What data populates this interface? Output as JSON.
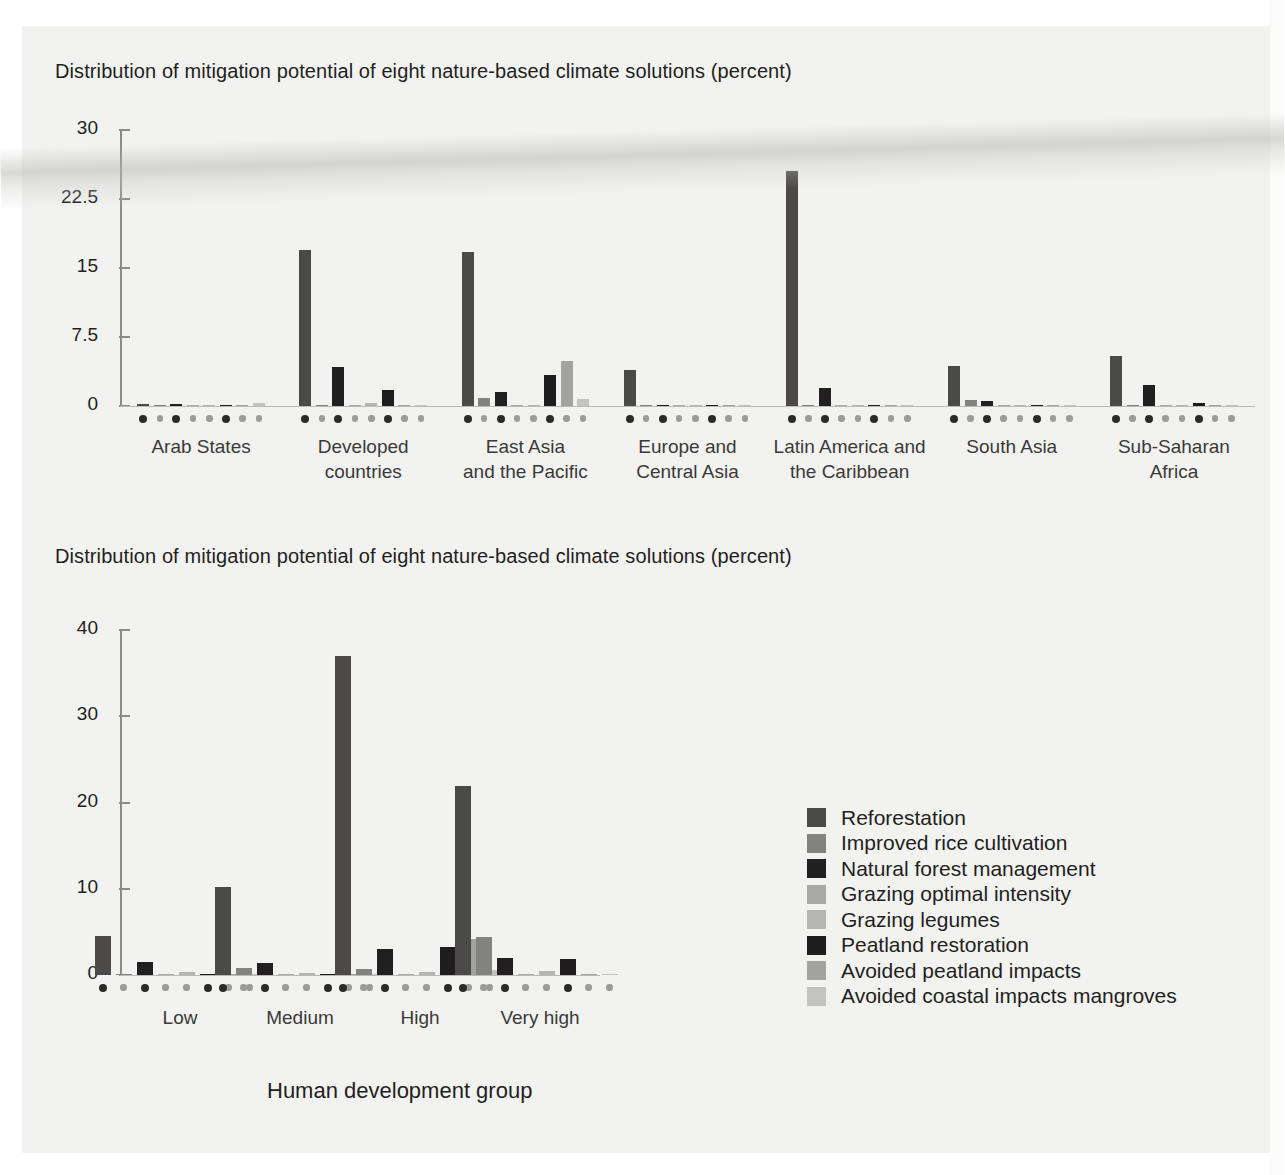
{
  "page": {
    "background": "#f2f2f0",
    "axis_color": "#8b8b88",
    "text_color": "#231f20"
  },
  "series_colors": {
    "reforestation": "#4c4a49",
    "improved_rice_cultivation": "#828281",
    "natural_forest_management": "#211f1f",
    "grazing_optimal_intensity": "#a9a9a7",
    "grazing_legumes": "#b5b5b3",
    "peatland_restoration": "#1e1c1c",
    "avoided_peatland_impacts": "#a2a2a0",
    "avoided_coastal_impacts_mangroves": "#c3c3c1"
  },
  "legend": {
    "items": [
      {
        "label": "Reforestation",
        "color": "#4c4a49"
      },
      {
        "label": "Improved rice cultivation",
        "color": "#828281"
      },
      {
        "label": "Natural forest management",
        "color": "#211f1f"
      },
      {
        "label": "Grazing optimal intensity",
        "color": "#a9a9a7"
      },
      {
        "label": "Grazing legumes",
        "color": "#b5b5b3"
      },
      {
        "label": "Peatland restoration",
        "color": "#1e1c1c"
      },
      {
        "label": "Avoided peatland impacts",
        "color": "#a2a2a0"
      },
      {
        "label": "Avoided coastal impacts mangroves",
        "color": "#c3c3c1"
      }
    ]
  },
  "chart_data": [
    {
      "id": "by-region",
      "type": "bar",
      "title": "Distribution of mitigation potential of eight nature-based climate solutions (percent)",
      "xlabel": "",
      "ylabel": "",
      "ylim": [
        0,
        30
      ],
      "yticks": [
        0,
        7.5,
        15,
        22.5,
        30
      ],
      "ytick_labels": [
        "0",
        "7.5",
        "15",
        "22.5",
        "30"
      ],
      "grid": false,
      "legend_position": "none",
      "categories": [
        "Arab States",
        "Developed\ncountries",
        "East Asia\nand the Pacific",
        "Europe and\nCentral Asia",
        "Latin America and\nthe Caribbean",
        "South Asia",
        "Sub-Saharan\nAfrica"
      ],
      "series": [
        {
          "name": "Reforestation",
          "values": [
            0.25,
            17.0,
            16.7,
            3.9,
            25.5,
            4.3,
            5.4
          ]
        },
        {
          "name": "Improved rice cultivation",
          "values": [
            0.02,
            0.0,
            0.9,
            0.05,
            0.0,
            0.7,
            0.0
          ]
        },
        {
          "name": "Natural forest management",
          "values": [
            0.2,
            4.2,
            1.5,
            0.1,
            2.0,
            0.5,
            2.3
          ]
        },
        {
          "name": "Grazing optimal intensity",
          "values": [
            0.02,
            0.1,
            0.0,
            0.02,
            0.05,
            0.05,
            0.05
          ]
        },
        {
          "name": "Grazing legumes",
          "values": [
            0.05,
            0.3,
            0.0,
            0.03,
            0.05,
            0.05,
            0.05
          ]
        },
        {
          "name": "Peatland restoration",
          "values": [
            0.03,
            1.7,
            3.4,
            0.15,
            0.15,
            0.05,
            0.3
          ]
        },
        {
          "name": "Avoided peatland impacts",
          "values": [
            0.0,
            0.0,
            4.9,
            0.0,
            0.05,
            0.0,
            0.1
          ]
        },
        {
          "name": "Avoided coastal impacts mangroves",
          "values": [
            0.3,
            0.0,
            0.8,
            0.0,
            0.1,
            0.05,
            0.1
          ]
        }
      ]
    },
    {
      "id": "by-hdi-group",
      "type": "bar",
      "title": "Distribution of mitigation potential of eight nature-based climate solutions (percent)",
      "xlabel": "Human development group",
      "ylabel": "",
      "ylim": [
        0,
        40
      ],
      "yticks": [
        0,
        10,
        20,
        30,
        40
      ],
      "ytick_labels": [
        "0",
        "10",
        "20",
        "30",
        "40"
      ],
      "grid": false,
      "legend_position": "right",
      "categories": [
        "Low",
        "Medium",
        "High",
        "Very high"
      ],
      "series": [
        {
          "name": "Reforestation",
          "values": [
            4.5,
            10.2,
            37.0,
            21.9
          ]
        },
        {
          "name": "Improved rice cultivation",
          "values": [
            0.1,
            0.8,
            0.7,
            4.4
          ]
        },
        {
          "name": "Natural forest management",
          "values": [
            1.5,
            1.4,
            3.0,
            2.0
          ]
        },
        {
          "name": "Grazing optimal intensity",
          "values": [
            0.1,
            0.1,
            0.15,
            0.1
          ]
        },
        {
          "name": "Grazing legumes",
          "values": [
            0.35,
            0.2,
            0.3,
            0.5
          ]
        },
        {
          "name": "Peatland restoration",
          "values": [
            0.05,
            0.05,
            3.2,
            1.9
          ]
        },
        {
          "name": "Avoided peatland impacts",
          "values": [
            0.0,
            0.0,
            4.2,
            0.1
          ]
        },
        {
          "name": "Avoided coastal impacts mangroves",
          "values": [
            0.1,
            0.05,
            0.6,
            0.15
          ]
        }
      ]
    }
  ]
}
